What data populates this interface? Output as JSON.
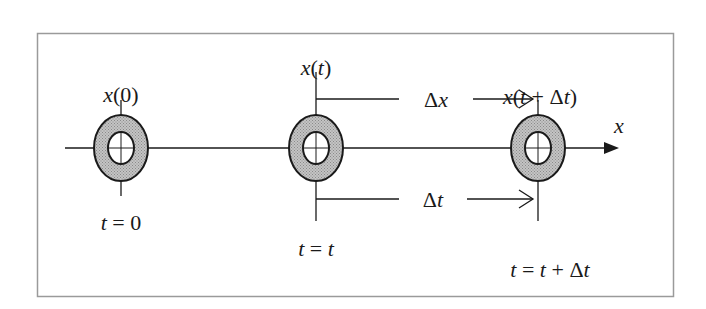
{
  "diagram": {
    "type": "particle-displacement-timeline",
    "axis_label": "x",
    "positions": [
      {
        "id": "p0",
        "top_label": "x(0)",
        "bottom_label": "t = 0"
      },
      {
        "id": "p1",
        "top_label": "x(t)",
        "bottom_label": "t = t"
      },
      {
        "id": "p2",
        "top_label": "x(t + Δt)",
        "bottom_label": "t = t + Δt"
      }
    ],
    "intervals": {
      "displacement_label": "Δx",
      "time_label": "Δt"
    },
    "colors": {
      "line": "#1a1a1a",
      "ring_fill": "#a8a8a8",
      "frame": "#9a9a9a",
      "background": "#ffffff"
    }
  }
}
